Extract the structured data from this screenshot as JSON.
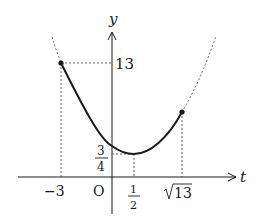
{
  "figure": {
    "function": "y = t^2 - t + 1",
    "axes": {
      "x_label": "t",
      "y_label": "y",
      "origin_label": "O"
    },
    "labels": {
      "y_13": "13",
      "y_three_quarters_num": "3",
      "y_three_quarters_den": "4",
      "x_neg3": "−3",
      "x_half_num": "1",
      "x_half_den": "2",
      "x_sqrt13_radicand": "13"
    },
    "points": [
      {
        "name": "left-endpoint",
        "t": -3,
        "y": 13,
        "filled": true
      },
      {
        "name": "vertex",
        "t": 0.5,
        "y": 0.75,
        "filled": false
      },
      {
        "name": "right-endpoint",
        "t": "√13",
        "y": "13 - √13 + 1",
        "filled": true
      }
    ],
    "domain_solid": "-3 ≤ t ≤ √13",
    "colors": {
      "ink": "#1a1a1a",
      "guide": "#555555",
      "background": "#ffffff"
    }
  }
}
